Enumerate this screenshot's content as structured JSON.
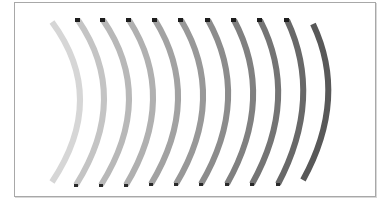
{
  "frame": {
    "x": 14,
    "y": 2,
    "width": 362,
    "height": 195,
    "border": "#a8a8a8"
  },
  "stroke_width": 6,
  "arcs": [
    {
      "top": [
        52,
        22
      ],
      "mid": [
        80,
        100
      ],
      "bottom": [
        52,
        182
      ],
      "color": "#d6d6d6",
      "cap_top": false,
      "cap_bottom": false
    },
    {
      "top": [
        78,
        20
      ],
      "mid": [
        104,
        100
      ],
      "bottom": [
        76,
        185
      ],
      "color": "#c4c4c4",
      "cap_top": true,
      "cap_bottom": true
    },
    {
      "top": [
        103,
        20
      ],
      "mid": [
        129,
        100
      ],
      "bottom": [
        101,
        185
      ],
      "color": "#b8b8b8",
      "cap_top": true,
      "cap_bottom": true
    },
    {
      "top": [
        129,
        20
      ],
      "mid": [
        153,
        100
      ],
      "bottom": [
        126,
        185
      ],
      "color": "#b0b0b0",
      "cap_top": true,
      "cap_bottom": true
    },
    {
      "top": [
        155,
        20
      ],
      "mid": [
        178,
        100
      ],
      "bottom": [
        151,
        184
      ],
      "color": "#a2a2a2",
      "cap_top": true,
      "cap_bottom": true
    },
    {
      "top": [
        181,
        20
      ],
      "mid": [
        203,
        100
      ],
      "bottom": [
        176,
        184
      ],
      "color": "#989898",
      "cap_top": true,
      "cap_bottom": true
    },
    {
      "top": [
        208,
        20
      ],
      "mid": [
        228,
        100
      ],
      "bottom": [
        201,
        184
      ],
      "color": "#8c8c8c",
      "cap_top": true,
      "cap_bottom": true
    },
    {
      "top": [
        234,
        20
      ],
      "mid": [
        253,
        100
      ],
      "bottom": [
        227,
        184
      ],
      "color": "#808080",
      "cap_top": true,
      "cap_bottom": true
    },
    {
      "top": [
        260,
        20
      ],
      "mid": [
        278,
        100
      ],
      "bottom": [
        252,
        184
      ],
      "color": "#747474",
      "cap_top": true,
      "cap_bottom": true
    },
    {
      "top": [
        287,
        20
      ],
      "mid": [
        303,
        100
      ],
      "bottom": [
        278,
        184
      ],
      "color": "#686868",
      "cap_top": true,
      "cap_bottom": true
    },
    {
      "top": [
        313,
        24
      ],
      "mid": [
        328,
        100
      ],
      "bottom": [
        303,
        180
      ],
      "color": "#585858",
      "cap_top": false,
      "cap_bottom": false
    }
  ]
}
